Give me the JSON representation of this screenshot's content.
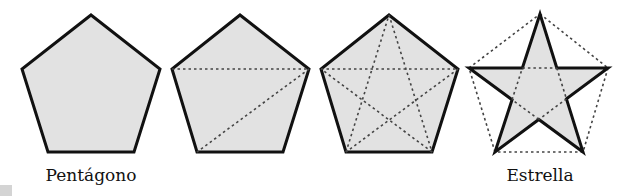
{
  "diagram": {
    "colors": {
      "fill": "#e2e2e2",
      "outline": "#111111",
      "dotted": "#444444",
      "background": "#ffffff",
      "corner_swatch": "#d4d4d4"
    },
    "figures": [
      {
        "id": "pentagon-plain",
        "shape": "pentagon",
        "vertices": [
          [
            91,
            15
          ],
          [
            160,
            69
          ],
          [
            134,
            152
          ],
          [
            48,
            152
          ],
          [
            22,
            69
          ]
        ],
        "diagonals": [],
        "label": "Pentágono",
        "label_pos": [
          91,
          176
        ]
      },
      {
        "id": "pentagon-two-diagonals",
        "shape": "pentagon",
        "vertices": [
          [
            240,
            15
          ],
          [
            309,
            69
          ],
          [
            283,
            152
          ],
          [
            197,
            152
          ],
          [
            172,
            69
          ]
        ],
        "diagonals": [
          [
            [
              172,
              69
            ],
            [
              309,
              69
            ]
          ],
          [
            [
              309,
              69
            ],
            [
              197,
              152
            ]
          ]
        ],
        "label": "",
        "label_pos": null
      },
      {
        "id": "pentagon-all-diagonals",
        "shape": "pentagon",
        "vertices": [
          [
            389,
            15
          ],
          [
            458,
            69
          ],
          [
            432,
            152
          ],
          [
            346,
            152
          ],
          [
            321,
            69
          ]
        ],
        "diagonals": [
          [
            [
              321,
              69
            ],
            [
              458,
              69
            ]
          ],
          [
            [
              458,
              69
            ],
            [
              346,
              152
            ]
          ],
          [
            [
              346,
              152
            ],
            [
              389,
              15
            ]
          ],
          [
            [
              389,
              15
            ],
            [
              432,
              152
            ]
          ],
          [
            [
              432,
              152
            ],
            [
              321,
              69
            ]
          ]
        ],
        "label": "",
        "label_pos": null
      },
      {
        "id": "star",
        "shape": "star",
        "vertices": [
          [
            540,
            14
          ],
          [
            608,
            68
          ],
          [
            583,
            152
          ],
          [
            495,
            152
          ],
          [
            469,
            68
          ]
        ],
        "diagonals": [],
        "label": "Estrella",
        "label_pos": [
          540,
          176
        ]
      }
    ],
    "labels": {
      "pentagon": "Pentágono",
      "star": "Estrella"
    }
  }
}
